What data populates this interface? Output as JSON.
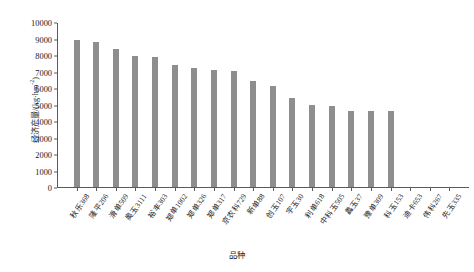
{
  "chart_data": {
    "type": "bar",
    "title": "",
    "xlabel": "品种",
    "ylabel": "经济产量/(kg·hm-2)",
    "ylabel_main": "经济产量/(kg·hm",
    "ylabel_sup": "-2",
    "ylabel_tail": ")",
    "ylim": [
      0,
      10000
    ],
    "ytick_values": [
      0,
      1000,
      2000,
      3000,
      4000,
      5000,
      6000,
      7000,
      8000,
      9000,
      10000
    ],
    "ytick_labels": [
      "0",
      "1000",
      "2000",
      "3000",
      "4000",
      "5000",
      "6000",
      "7000",
      "8000",
      "9000",
      "10000"
    ],
    "grid": false,
    "legend": "none",
    "bar_color": "#8e8e8e",
    "categories": [
      "秋乐368",
      "隆平206",
      "滑单509",
      "奥玉3111",
      "裕丰303",
      "郑单1002",
      "郑单326",
      "郑单317",
      "京农科729",
      "新单88",
      "创玉107",
      "宇玉30",
      "利单618",
      "中科玉505",
      "蠡玉37",
      "豫单309",
      "科玉153",
      "迪卡653",
      "伟科267",
      "先玉335"
    ],
    "values": [
      8900,
      8780,
      8370,
      7940,
      7850,
      7380,
      7240,
      7110,
      7030,
      6450,
      6130,
      5400,
      4950,
      4900,
      4620,
      4600,
      4580,
      0,
      0,
      0
    ]
  }
}
